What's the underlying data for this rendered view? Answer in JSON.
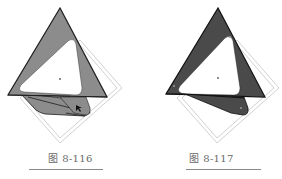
{
  "figures": [
    {
      "caption": "图 8-116",
      "variant": "light-fill",
      "colors": {
        "fill": "#8c8c8c",
        "stroke": "#1e1e1e",
        "guide": "#c4c4c4",
        "hole": "#ffffff"
      }
    },
    {
      "caption": "图 8-117",
      "variant": "dark-fill",
      "colors": {
        "fill": "#4a4a4a",
        "stroke": "#111111",
        "guide": "#c4c4c4",
        "hole": "#ffffff"
      }
    }
  ]
}
